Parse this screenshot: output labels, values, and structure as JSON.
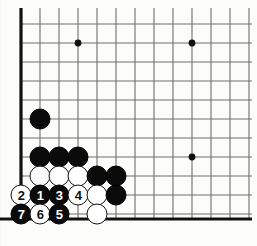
{
  "figure": {
    "kind": "go-board-diagram",
    "width": 257,
    "height": 246,
    "background_color": "#fbfbfa",
    "line_color": "#6e6e6e",
    "edge_line_color": "#111111",
    "black_stone_color": "#0b0b0b",
    "white_stone_color": "#ffffff",
    "stone_outline_color": "#141414"
  },
  "board": {
    "corner": "bottom-left",
    "origin_x": 21,
    "origin_y": 24,
    "spacing": 19,
    "cols": 12,
    "rows": 11,
    "left_edge_x": 21,
    "bottom_edge_y": 219,
    "thick_edge_width": 3.2,
    "grid_line_width": 1.1,
    "star_point_radius": 3.4,
    "star_points": [
      {
        "x": 78,
        "y": 43
      },
      {
        "x": 192,
        "y": 43
      },
      {
        "x": 192,
        "y": 157
      }
    ]
  },
  "stones": [
    {
      "name": "black-stone-c2r6",
      "color": "black",
      "x": 40,
      "y": 119,
      "label": ""
    },
    {
      "name": "black-stone-c2r9",
      "color": "black",
      "x": 40,
      "y": 157,
      "label": ""
    },
    {
      "name": "black-stone-c3r9",
      "color": "black",
      "x": 59,
      "y": 157,
      "label": ""
    },
    {
      "name": "black-stone-c4r9",
      "color": "black",
      "x": 78,
      "y": 157,
      "label": ""
    },
    {
      "name": "white-stone-c2r10",
      "color": "white",
      "x": 40,
      "y": 176,
      "label": ""
    },
    {
      "name": "white-stone-c3r10",
      "color": "white",
      "x": 59,
      "y": 176,
      "label": ""
    },
    {
      "name": "white-stone-c4r10",
      "color": "white",
      "x": 78,
      "y": 176,
      "label": ""
    },
    {
      "name": "black-stone-c5r10",
      "color": "black",
      "x": 97,
      "y": 176,
      "label": ""
    },
    {
      "name": "black-stone-c6r10",
      "color": "black",
      "x": 116,
      "y": 176,
      "label": ""
    },
    {
      "name": "white-stone-move-2",
      "color": "white",
      "x": 21,
      "y": 195,
      "label": "2"
    },
    {
      "name": "black-stone-move-1",
      "color": "black",
      "x": 40,
      "y": 195,
      "label": "1"
    },
    {
      "name": "black-stone-move-3",
      "color": "black",
      "x": 59,
      "y": 195,
      "label": "3"
    },
    {
      "name": "white-stone-move-4",
      "color": "white",
      "x": 78,
      "y": 195,
      "label": "4"
    },
    {
      "name": "white-stone-c5r11",
      "color": "white",
      "x": 97,
      "y": 195,
      "label": ""
    },
    {
      "name": "black-stone-c6r11",
      "color": "black",
      "x": 116,
      "y": 195,
      "label": ""
    },
    {
      "name": "black-stone-move-7",
      "color": "black",
      "x": 21,
      "y": 214,
      "label": "7"
    },
    {
      "name": "white-stone-move-6",
      "color": "white",
      "x": 40,
      "y": 214,
      "label": "6"
    },
    {
      "name": "black-stone-move-5",
      "color": "black",
      "x": 59,
      "y": 214,
      "label": "5"
    },
    {
      "name": "white-stone-c5r12",
      "color": "white",
      "x": 97,
      "y": 214,
      "label": ""
    }
  ],
  "move_sequence": {
    "moves": [
      {
        "number": "1",
        "color": "black"
      },
      {
        "number": "2",
        "color": "white"
      },
      {
        "number": "3",
        "color": "black"
      },
      {
        "number": "4",
        "color": "white"
      },
      {
        "number": "5",
        "color": "black"
      },
      {
        "number": "6",
        "color": "white"
      },
      {
        "number": "7",
        "color": "black"
      }
    ]
  }
}
